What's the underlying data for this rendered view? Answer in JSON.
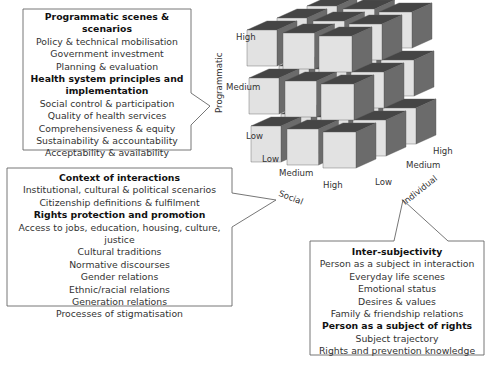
{
  "programmatic_box": {
    "lines": [
      {
        "text": "Programmatic scenes & scenarios",
        "bold": true
      },
      {
        "text": "Policy & technical mobilisation",
        "bold": false
      },
      {
        "text": "Government investment",
        "bold": false
      },
      {
        "text": "Planning & evaluation",
        "bold": false
      },
      {
        "text": "Health system principles and",
        "bold": true
      },
      {
        "text": "implementation",
        "bold": true
      },
      {
        "text": "Social control & participation",
        "bold": false
      },
      {
        "text": "Quality of health services",
        "bold": false
      },
      {
        "text": "Comprehensiveness & equity",
        "bold": false
      },
      {
        "text": "Sustainability & accountability",
        "bold": false
      },
      {
        "text": "Acceptability & availability",
        "bold": false
      }
    ]
  },
  "social_box": {
    "lines": [
      {
        "text": "Context of interactions",
        "bold": true
      },
      {
        "text": "Institutional, cultural & political scenarios",
        "bold": false
      },
      {
        "text": "Citizenship definitions & fulfilment",
        "bold": false
      },
      {
        "text": "Rights protection and promotion",
        "bold": true
      },
      {
        "text": "Access to jobs, education, housing, culture, justice",
        "bold": false
      },
      {
        "text": "Cultural traditions",
        "bold": false
      },
      {
        "text": "Normative discourses",
        "bold": false
      },
      {
        "text": "Gender relations",
        "bold": false
      },
      {
        "text": "Ethnic/racial relations",
        "bold": false
      },
      {
        "text": "Generation relations",
        "bold": false
      },
      {
        "text": "Processes of stigmatisation",
        "bold": false
      }
    ]
  },
  "individual_box": {
    "lines": [
      {
        "text": "Inter-subjectivity",
        "bold": true
      },
      {
        "text": "Person as a subject in interaction",
        "bold": false
      },
      {
        "text": "Everyday life scenes",
        "bold": false
      },
      {
        "text": "Emotional status",
        "bold": false
      },
      {
        "text": "Desires & values",
        "bold": false
      },
      {
        "text": "Family & friendship relations",
        "bold": false
      },
      {
        "text": "Person as a subject of rights",
        "bold": true
      },
      {
        "text": "Subject trajectory",
        "bold": false
      },
      {
        "text": "Rights and prevention knowledge",
        "bold": false
      }
    ]
  },
  "axes": {
    "programmatic": {
      "title": "Programmatic",
      "levels": [
        "High",
        "Medium",
        "Low"
      ]
    },
    "social": {
      "title": "Social",
      "levels": [
        "Low",
        "Medium",
        "High"
      ]
    },
    "individual": {
      "title": "Individual",
      "levels": [
        "Low",
        "Medium",
        "High"
      ]
    }
  },
  "colors": {
    "front_face": "#e2e2e2",
    "side_face": "#6b6b6b",
    "top_face": "#454545",
    "outline": "#555555"
  }
}
